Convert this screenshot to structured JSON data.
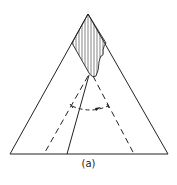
{
  "figure": {
    "caption": "(a)",
    "stroke_color": "#222222",
    "background": "#ffffff",
    "elements": {
      "triangle": "outer-triangle",
      "hatched_region": "hatched-apex-region",
      "solid_line": "solid-internal-line",
      "dashed_lines": [
        "dashed-left-line",
        "dashed-right-line"
      ],
      "rotation_arc": "dashed-arc-with-arrow"
    }
  }
}
